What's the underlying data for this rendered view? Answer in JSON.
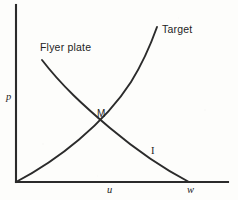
{
  "figure": {
    "background_color": "#fdfdfb",
    "ink_color": "#242424",
    "width": 238,
    "height": 200
  },
  "chart_data": {
    "type": "line",
    "title": "",
    "subtitle": "",
    "xlabel": "u",
    "ylabel": "p",
    "grid": false,
    "legend_position": "inline-curve-labels",
    "axes": {
      "x_axis": {
        "label": "u",
        "label_x": 110,
        "from": [
          16,
          182
        ],
        "to": [
          228,
          182
        ],
        "arrow": false
      },
      "y_axis": {
        "label": "p",
        "label_y": 98,
        "from": [
          16,
          182
        ],
        "to": [
          16,
          5
        ],
        "arrow": false
      },
      "origin": [
        16,
        182
      ]
    },
    "annotations": [
      {
        "name": "u",
        "text": "u",
        "x": 110,
        "y": 190,
        "style": "italic-serif"
      },
      {
        "name": "w",
        "text": "w",
        "x": 190,
        "y": 190,
        "style": "italic-serif"
      },
      {
        "name": "p",
        "text": "p",
        "x": 8,
        "y": 98,
        "style": "italic-serif"
      }
    ],
    "series": [
      {
        "name": "Target",
        "label": "Target",
        "label_x": 162,
        "label_y": 30,
        "shape": "concave-up rising curve",
        "path": "M 16 182 C 58 160, 104 124, 131 82 C 144 61, 152 41, 157 27",
        "points": [
          [
            16,
            182
          ],
          [
            45,
            167
          ],
          [
            72,
            148
          ],
          [
            92,
            114
          ],
          [
            115,
            95
          ],
          [
            133,
            69
          ],
          [
            147,
            45
          ],
          [
            157,
            27
          ]
        ]
      },
      {
        "name": "Flyer plate",
        "label": "Flyer plate",
        "label_x": 40,
        "label_y": 48,
        "shape": "gently convex falling curve",
        "path": "M 42 60 C 62 86, 84 106, 110 128 C 135 149, 166 170, 189 182",
        "points": [
          [
            42,
            60
          ],
          [
            60,
            83
          ],
          [
            78,
            101
          ],
          [
            92,
            114
          ],
          [
            112,
            130
          ],
          [
            140,
            152
          ],
          [
            168,
            170
          ],
          [
            189,
            182
          ]
        ]
      }
    ],
    "markers": [
      {
        "name": "M",
        "label": "M",
        "x": 92,
        "y": 114,
        "label_x": 97,
        "label_y": 110,
        "description": "impedance match intersection point"
      },
      {
        "name": "I",
        "label": "I",
        "x": 152,
        "y": 152,
        "description": "label on the reflected flyer-plate branch"
      }
    ]
  },
  "labels": {
    "target": "Target",
    "flyer_plate": "Flyer plate",
    "match_point": "M",
    "branch_I": "I",
    "axis_p": "p",
    "axis_u": "u",
    "axis_w": "w"
  }
}
